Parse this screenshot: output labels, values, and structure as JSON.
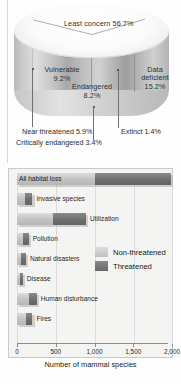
{
  "figure": {
    "pie": {
      "type": "pie",
      "title": "",
      "labels_on_chart": [
        {
          "name": "Least concern",
          "value": 56.7,
          "text": "Least concern 56.7%"
        },
        {
          "name": "Vulnerable",
          "value": 9.2,
          "text_line1": "Vulnerable",
          "text_line2": "9.2%"
        },
        {
          "name": "Endangered",
          "value": 8.2,
          "text_line1": "Endangered",
          "text_line2": "8.2%"
        },
        {
          "name": "Data deficient",
          "value": 15.2,
          "text_line1": "Data",
          "text_line2": "deficient",
          "text_line3": "15.2%"
        }
      ],
      "callouts": [
        {
          "name": "Near threatened",
          "value": 5.9,
          "text": "Near threatened 5.9%"
        },
        {
          "name": "Critically endangered",
          "value": 3.4,
          "text": "Critically endangered 3.4%"
        },
        {
          "name": "Extinct",
          "value": 1.4,
          "text": "Extinct 1.4%"
        }
      ]
    },
    "bars": {
      "type": "bar",
      "orientation": "horizontal",
      "stacked": true,
      "xlabel": "Number of mammal species",
      "xlim": [
        0,
        2000
      ],
      "xticks": [
        0,
        500,
        1000,
        1500,
        2000
      ],
      "xtick_labels": [
        "0",
        "500",
        "1,000",
        "1,500",
        "2,000"
      ],
      "grid": true,
      "legend_position": "center-right",
      "categories": [
        "All habitat loss",
        "Invasive species",
        "Utilization",
        "Pollution",
        "Natural disasters",
        "Disease",
        "Human disturbance",
        "Fires"
      ],
      "series": [
        {
          "name": "Non-threatened",
          "color": "#c6c6c6",
          "values": [
            1010,
            105,
            460,
            75,
            55,
            40,
            155,
            115
          ]
        },
        {
          "name": "Threatened",
          "color": "#6b6b6b",
          "values": [
            980,
            95,
            430,
            75,
            60,
            35,
            100,
            85
          ]
        }
      ],
      "legend": [
        {
          "label": "Non-threatened",
          "color": "#c6c6c6"
        },
        {
          "label": "Threatened",
          "color": "#6b6b6b"
        }
      ]
    }
  }
}
